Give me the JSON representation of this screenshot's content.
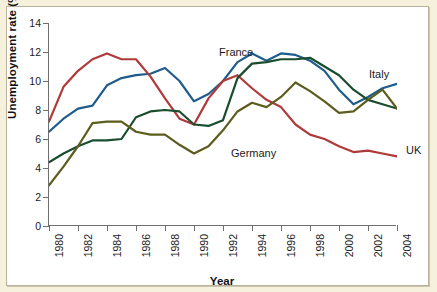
{
  "figure": {
    "background_color": "#f6f1dc",
    "plot_background_color": "#ffffff",
    "axis_color": "#6f6f6f"
  },
  "labels": {
    "ylabel": "Unemployment rate (%)",
    "xlabel": "Year"
  },
  "annotations": [
    {
      "name": "france",
      "text": "France",
      "x_px": 212,
      "y_px": 40,
      "color": "#1a1a1a"
    },
    {
      "name": "italy",
      "text": "Italy",
      "x_px": 362,
      "y_px": 62,
      "color": "#1a1a1a"
    },
    {
      "name": "germany",
      "text": "Germany",
      "x_px": 224,
      "y_px": 141,
      "color": "#1a1a1a"
    },
    {
      "name": "uk",
      "text": "UK",
      "x_px": 399,
      "y_px": 138,
      "color": "#1a1a1a"
    }
  ],
  "chart_data": {
    "type": "line",
    "title": "",
    "xlabel": "Year",
    "ylabel": "Unemployment rate (%)",
    "xlim": [
      1980,
      2004
    ],
    "ylim": [
      0,
      14
    ],
    "ytick_values": [
      0,
      2,
      4,
      6,
      8,
      10,
      12,
      14
    ],
    "xtick_labels": [
      "1980",
      "1982",
      "1984",
      "1986",
      "1988",
      "1990",
      "1992",
      "1994",
      "1996",
      "1998",
      "2000",
      "2002",
      "2004"
    ],
    "xtick_values": [
      1980,
      1982,
      1984,
      1986,
      1988,
      1990,
      1992,
      1994,
      1996,
      1998,
      2000,
      2002,
      2004
    ],
    "grid": false,
    "legend": "inline-annotations",
    "x": [
      1980,
      1981,
      1982,
      1983,
      1984,
      1985,
      1986,
      1987,
      1988,
      1989,
      1990,
      1991,
      1992,
      1993,
      1994,
      1995,
      1996,
      1997,
      1998,
      1999,
      2000,
      2001,
      2002,
      2003,
      2004
    ],
    "series": [
      {
        "name": "France",
        "color": "#1f5c8b",
        "values": [
          6.5,
          7.4,
          8.1,
          8.3,
          9.7,
          10.2,
          10.4,
          10.5,
          10.9,
          10.0,
          8.6,
          9.1,
          10.0,
          11.3,
          11.9,
          11.4,
          11.9,
          11.8,
          11.4,
          10.7,
          9.4,
          8.4,
          8.9,
          9.5,
          9.8
        ],
        "linewidth": 2.2
      },
      {
        "name": "UK",
        "color": "#b03a3a",
        "values": [
          7.2,
          9.6,
          10.7,
          11.5,
          11.9,
          11.5,
          11.5,
          10.3,
          8.8,
          7.4,
          7.0,
          8.8,
          10.0,
          10.4,
          9.5,
          8.7,
          8.2,
          7.0,
          6.3,
          6.0,
          5.5,
          5.1,
          5.2,
          5.0,
          4.8
        ],
        "linewidth": 2.2
      },
      {
        "name": "Italy",
        "color": "#1a4d2e",
        "values": [
          4.4,
          5.0,
          5.5,
          5.9,
          5.9,
          6.0,
          7.5,
          7.9,
          8.0,
          7.9,
          7.0,
          6.9,
          7.3,
          10.2,
          11.2,
          11.3,
          11.5,
          11.5,
          11.6,
          11.0,
          10.4,
          9.4,
          8.7,
          8.4,
          8.1
        ],
        "linewidth": 2.2
      },
      {
        "name": "Germany",
        "color": "#5c5c1e",
        "values": [
          2.8,
          4.1,
          5.5,
          7.1,
          7.2,
          7.2,
          6.5,
          6.3,
          6.3,
          5.6,
          5.0,
          5.5,
          6.6,
          7.9,
          8.5,
          8.2,
          8.9,
          9.9,
          9.3,
          8.6,
          7.8,
          7.9,
          8.7,
          9.4,
          8.1
        ],
        "linewidth": 2.2
      }
    ]
  }
}
